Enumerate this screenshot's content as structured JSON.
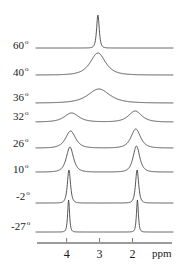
{
  "figure": {
    "kind": "stacked-nmr-spectra",
    "width": 193,
    "height": 274,
    "background": "#ffffff",
    "trace_color": "#3a3a3a",
    "axis_color": "#7a7a7a",
    "text_color": "#1a1a1a"
  },
  "axis": {
    "unit_label": "ppm",
    "tick_labels": [
      "4",
      "3",
      "2"
    ],
    "tick_values": [
      4,
      3,
      2
    ],
    "x_min_ppm": 4.9,
    "x_max_ppm": 0.8,
    "x_left_px": 37,
    "x_right_px": 172,
    "baseline_y_px": 243,
    "direction": "decreasing-left-to-right"
  },
  "traces": [
    {
      "label": "60",
      "degree_symbol": "o",
      "label_x": 13,
      "label_y": 39,
      "baseline_y": 48,
      "peaks": [
        {
          "center_ppm": 3.05,
          "height": 33,
          "width_ppm": 0.1
        }
      ]
    },
    {
      "label": "40",
      "degree_symbol": "o",
      "label_x": 13,
      "label_y": 66,
      "baseline_y": 75,
      "peaks": [
        {
          "center_ppm": 3.05,
          "height": 22,
          "width_ppm": 0.58
        }
      ]
    },
    {
      "label": "36",
      "degree_symbol": "o",
      "label_x": 13,
      "label_y": 91,
      "baseline_y": 103,
      "peaks": [
        {
          "center_ppm": 3.02,
          "height": 14,
          "width_ppm": 0.82
        }
      ]
    },
    {
      "label": "32",
      "degree_symbol": "o",
      "label_x": 13,
      "label_y": 110,
      "baseline_y": 122,
      "peaks": [
        {
          "center_ppm": 3.85,
          "height": 9,
          "width_ppm": 0.55
        },
        {
          "center_ppm": 1.92,
          "height": 11,
          "width_ppm": 0.5
        }
      ]
    },
    {
      "label": "26",
      "degree_symbol": "o",
      "label_x": 13,
      "label_y": 137,
      "baseline_y": 148,
      "peaks": [
        {
          "center_ppm": 3.88,
          "height": 17,
          "width_ppm": 0.38
        },
        {
          "center_ppm": 1.9,
          "height": 19,
          "width_ppm": 0.36
        }
      ]
    },
    {
      "label": "10",
      "degree_symbol": "o",
      "label_x": 13,
      "label_y": 163,
      "baseline_y": 172,
      "peaks": [
        {
          "center_ppm": 3.9,
          "height": 25,
          "width_ppm": 0.27
        },
        {
          "center_ppm": 1.88,
          "height": 26,
          "width_ppm": 0.25
        }
      ]
    },
    {
      "label": "-2",
      "degree_symbol": "o",
      "label_x": 16,
      "label_y": 190,
      "baseline_y": 203,
      "peaks": [
        {
          "center_ppm": 3.93,
          "height": 33,
          "width_ppm": 0.12
        },
        {
          "center_ppm": 1.86,
          "height": 33,
          "width_ppm": 0.12
        }
      ]
    },
    {
      "label": "-27",
      "degree_symbol": "o",
      "label_x": 11,
      "label_y": 220,
      "baseline_y": 232,
      "peaks": [
        {
          "center_ppm": 3.94,
          "height": 32,
          "width_ppm": 0.07
        },
        {
          "center_ppm": 1.85,
          "height": 32,
          "width_ppm": 0.07
        }
      ]
    }
  ],
  "chart_data": {
    "type": "line",
    "title": "",
    "xlabel": "ppm",
    "ylabel": "",
    "xlim": [
      4.9,
      0.8
    ],
    "grid": false,
    "legend": "none",
    "xticks": [
      4,
      3,
      2
    ],
    "series": [
      {
        "name": "60 o",
        "peaks_ppm": [
          3.05
        ],
        "relative_heights": [
          33
        ],
        "linewidths_ppm": [
          0.1
        ]
      },
      {
        "name": "40 o",
        "peaks_ppm": [
          3.05
        ],
        "relative_heights": [
          22
        ],
        "linewidths_ppm": [
          0.58
        ]
      },
      {
        "name": "36 o",
        "peaks_ppm": [
          3.02
        ],
        "relative_heights": [
          14
        ],
        "linewidths_ppm": [
          0.82
        ]
      },
      {
        "name": "32 o",
        "peaks_ppm": [
          3.85,
          1.92
        ],
        "relative_heights": [
          9,
          11
        ],
        "linewidths_ppm": [
          0.55,
          0.5
        ]
      },
      {
        "name": "26 o",
        "peaks_ppm": [
          3.88,
          1.9
        ],
        "relative_heights": [
          17,
          19
        ],
        "linewidths_ppm": [
          0.38,
          0.36
        ]
      },
      {
        "name": "10 o",
        "peaks_ppm": [
          3.9,
          1.88
        ],
        "relative_heights": [
          25,
          26
        ],
        "linewidths_ppm": [
          0.27,
          0.25
        ]
      },
      {
        "name": "-2 o",
        "peaks_ppm": [
          3.93,
          1.86
        ],
        "relative_heights": [
          33,
          33
        ],
        "linewidths_ppm": [
          0.12,
          0.12
        ]
      },
      {
        "name": "-27 o",
        "peaks_ppm": [
          3.94,
          1.85
        ],
        "relative_heights": [
          32,
          32
        ],
        "linewidths_ppm": [
          0.07,
          0.07
        ]
      }
    ]
  }
}
